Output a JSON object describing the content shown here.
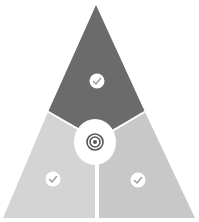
{
  "diagram": {
    "type": "triangle-segmented",
    "segments": [
      {
        "id": "top",
        "icon": "check-icon",
        "fill": "#6b6b6b"
      },
      {
        "id": "bottom-left",
        "icon": "check-icon",
        "fill": "#d4d4d4"
      },
      {
        "id": "bottom-right",
        "icon": "check-icon",
        "fill": "#c8c8c8"
      }
    ],
    "center": {
      "icon": "target-icon",
      "fill": "#ffffff",
      "ring_color": "#555555"
    },
    "divider_color": "#ffffff",
    "icon_badge_color": "#ffffff",
    "check_color": "#a0a0a0"
  }
}
